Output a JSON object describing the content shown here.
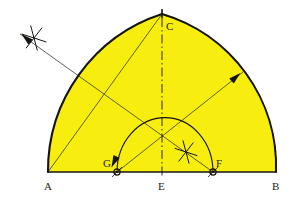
{
  "figure": {
    "type": "geometric-construction",
    "background_color": "#ffffff",
    "fill_color": "#f7ee10",
    "outline_color": "#141410",
    "thin_line_color": "#3b3a30",
    "construction_line_color": "#5c5b52",
    "label_color": "#26241c"
  },
  "baseline": {
    "from": "A",
    "to": "B",
    "y": 172,
    "x_start": 48,
    "x_end": 276
  },
  "points": [
    {
      "id": "A",
      "label": "A",
      "x": 48,
      "y": 172,
      "label_x": 44,
      "label_y": 190,
      "marker": "none"
    },
    {
      "id": "G",
      "label": "G",
      "x": 117,
      "y": 172,
      "label_x": 103,
      "label_y": 167,
      "marker": "compass-dot"
    },
    {
      "id": "E",
      "label": "E",
      "x": 162,
      "y": 172,
      "label_x": 158,
      "label_y": 190,
      "marker": "none"
    },
    {
      "id": "F",
      "label": "F",
      "x": 213,
      "y": 172,
      "label_x": 216,
      "label_y": 167,
      "marker": "compass-dot"
    },
    {
      "id": "B",
      "label": "B",
      "x": 276,
      "y": 172,
      "label_x": 272,
      "label_y": 190,
      "marker": "none"
    },
    {
      "id": "C",
      "label": "C",
      "x": 162,
      "y": 14,
      "label_x": 166,
      "label_y": 30,
      "marker": "apex-tick"
    }
  ],
  "arcs": {
    "outer_left": {
      "center": "F",
      "from": "A",
      "to": "C",
      "description": "Left arch arc struck from F through A up to apex C"
    },
    "outer_right": {
      "center": "G",
      "from": "C",
      "to": "B",
      "description": "Right arch arc struck from G through apex C down to B"
    },
    "inner": {
      "center": "E",
      "from": "G",
      "to": "F",
      "description": "Inner semicircular arc from G to F centred on E"
    }
  },
  "center_line": {
    "style": "dash-dot",
    "from_x": 162,
    "from_y": 18,
    "to_x": 162,
    "to_y": 178,
    "description": "Vertical centre line through C and E"
  },
  "radius_lines": [
    {
      "name": "A-to-C",
      "from": "A",
      "to": "C"
    },
    {
      "name": "G-to-upper-right",
      "from": "G",
      "to_x": 243,
      "to_y": 72,
      "arrow": "end"
    },
    {
      "name": "F-to-upper-left",
      "from": "F",
      "to_x": 20,
      "to_y": 34,
      "arrow": "end"
    }
  ],
  "arrows": [
    {
      "name": "radius-arrow-right",
      "x": 236,
      "y": 77,
      "angle": -42,
      "description": "Arrowhead on radius line pointing to right arc"
    },
    {
      "name": "radius-arrow-left",
      "x": 26,
      "y": 38,
      "angle": 221,
      "description": "Arrowhead on radius line pointing to upper-left construction star"
    },
    {
      "name": "arc-direction-arrow",
      "x": 114,
      "y": 162,
      "angle": 115,
      "description": "Arrowhead on inner arc pointing down toward G"
    }
  ],
  "construction_marks": [
    {
      "name": "star-upper-left",
      "x": 34,
      "y": 38,
      "rays": 3,
      "size": 13
    },
    {
      "name": "cross-centre",
      "x": 186,
      "y": 152,
      "rays": 3,
      "size": 12
    }
  ],
  "caption": ""
}
